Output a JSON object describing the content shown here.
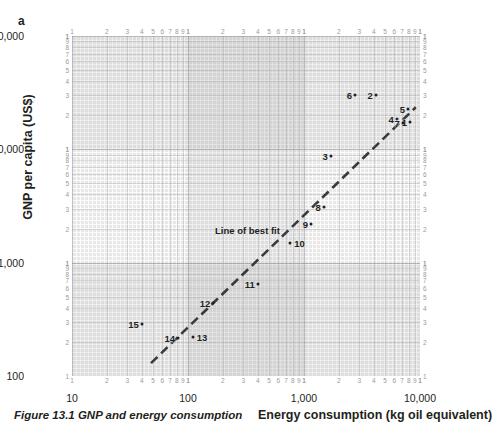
{
  "panel_label": "a",
  "caption": "Figure 13.1 GNP and energy consumption",
  "axes": {
    "ylabel": "GNP per capita (US$)",
    "xlabel": "Energy consumption (kg oil equivalent)",
    "x_major_labels": [
      "10",
      "100",
      "1,000",
      "10,000"
    ],
    "y_major_labels": [
      "100",
      "1,000",
      "10,000",
      "100,000"
    ],
    "minor_tick_labels": [
      "2",
      "3",
      "4",
      "5",
      "6",
      "7",
      "8",
      "9",
      "1"
    ]
  },
  "annotations": {
    "best_fit_label": "Line of best fit"
  },
  "chart_data": {
    "type": "scatter",
    "title": "Figure 13.1 GNP and energy consumption",
    "xlabel": "Energy consumption (kg oil equivalent)",
    "ylabel": "GNP per capita (US$)",
    "xscale": "log",
    "yscale": "log",
    "xlim": [
      10,
      10000
    ],
    "ylim": [
      100,
      100000
    ],
    "grid": true,
    "legend": false,
    "points": [
      {
        "label": "1",
        "x": 8200,
        "y": 17500
      },
      {
        "label": "2",
        "x": 4150,
        "y": 30000
      },
      {
        "label": "3",
        "x": 1700,
        "y": 8700
      },
      {
        "label": "4",
        "x": 6300,
        "y": 18500
      },
      {
        "label": "5",
        "x": 7900,
        "y": 22500
      },
      {
        "label": "6",
        "x": 2750,
        "y": 30000
      },
      {
        "label": "7",
        "x": 7100,
        "y": 17000
      },
      {
        "label": "8",
        "x": 1480,
        "y": 3100
      },
      {
        "label": "9",
        "x": 1150,
        "y": 2200
      },
      {
        "label": "10",
        "x": 760,
        "y": 1500
      },
      {
        "label": "11",
        "x": 400,
        "y": 650
      },
      {
        "label": "12",
        "x": 165,
        "y": 440
      },
      {
        "label": "13",
        "x": 110,
        "y": 220
      },
      {
        "label": "14",
        "x": 82,
        "y": 215
      },
      {
        "label": "15",
        "x": 40,
        "y": 290
      }
    ],
    "best_fit_line": {
      "label": "Line of best fit",
      "x_start": 48,
      "y_start": 130,
      "x_end": 9200,
      "y_end": 23500,
      "style": "dashed"
    }
  }
}
